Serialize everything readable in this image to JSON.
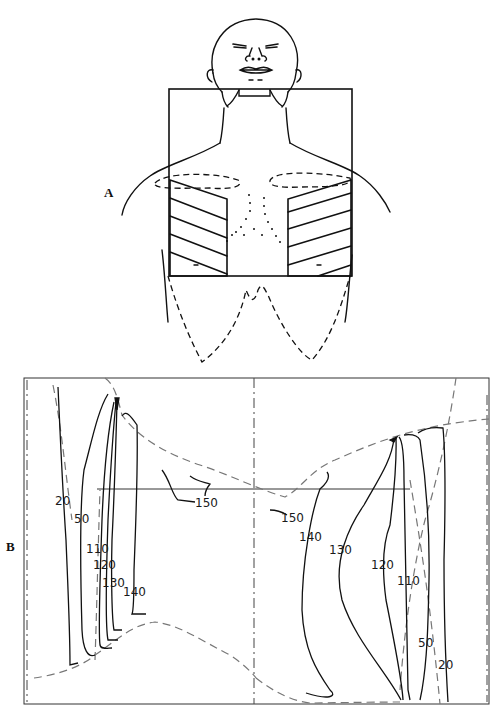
{
  "figure": {
    "panels": [
      {
        "id": "A",
        "label": "A",
        "description": "Patient outline (head, neck, chest) with square treatment field; hatched lung shielding blocks on both sides, dashed clavicle/breast outlines, dotted midline contour"
      },
      {
        "id": "B",
        "label": "B",
        "description": "Isodose distribution across treatment field with dashed body contour outline and central axis lines"
      }
    ],
    "isodose_labels": {
      "left": [
        "20",
        "50",
        "110",
        "120",
        "130",
        "140",
        "150"
      ],
      "right": [
        "150",
        "140",
        "130",
        "120",
        "110",
        "50",
        "20"
      ]
    },
    "colors": {
      "line": "#111111",
      "dashed_contour": "#777777",
      "background": "#ffffff"
    }
  }
}
